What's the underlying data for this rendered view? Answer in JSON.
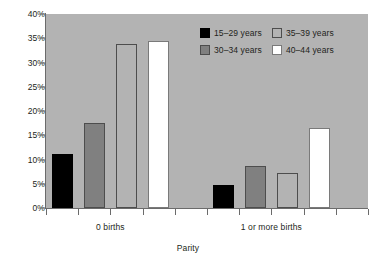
{
  "chart_data": {
    "type": "bar",
    "title": "",
    "subtitle": "",
    "xlabel": "Parity",
    "ylabel": "",
    "categories": [
      "0 births",
      "1 or more births"
    ],
    "series": [
      {
        "name": "15–29 years",
        "values": [
          11.1,
          4.8
        ],
        "swatch": "s0",
        "color": "#000000"
      },
      {
        "name": "30–34 years",
        "values": [
          17.5,
          8.6
        ],
        "swatch": "s1",
        "color": "#808080"
      },
      {
        "name": "35–39 years",
        "values": [
          33.8,
          7.3
        ],
        "swatch": "s2",
        "color": "none"
      },
      {
        "name": "40–44 years",
        "values": [
          34.5,
          16.6
        ],
        "swatch": "s3",
        "color": "#ffffff"
      }
    ],
    "ylim": [
      0,
      40
    ],
    "ytick_values": [
      0,
      5,
      10,
      15,
      20,
      25,
      30,
      35,
      40
    ],
    "ytick_labels": [
      "0%",
      "5%",
      "10%",
      "15%",
      "20%",
      "25%",
      "30%",
      "35%",
      "40%"
    ],
    "grid": false,
    "legend_position": "top-right",
    "legend_entries": [
      "15–29 years",
      "35–39 years",
      "30–34 years",
      "40–44 years"
    ],
    "plot_background": "#b3b3b3",
    "axis_color": "#6b6b6b",
    "text_color": "#231f20"
  }
}
